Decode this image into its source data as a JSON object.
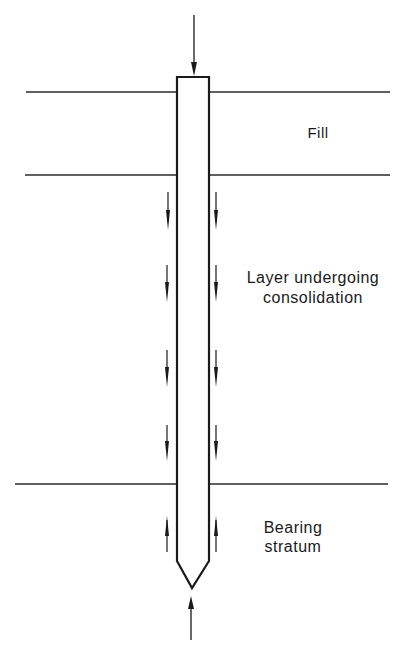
{
  "diagram": {
    "type": "pile-negative-skin-friction",
    "labels": {
      "fill": "Fill",
      "consolidating_layer_line1": "Layer undergoing",
      "consolidating_layer_line2": "consolidation",
      "bearing_line1": "Bearing",
      "bearing_line2": "stratum"
    },
    "layers": [
      {
        "name": "Fill",
        "top_y": 92,
        "bottom_y": 175
      },
      {
        "name": "Layer undergoing consolidation",
        "top_y": 175,
        "bottom_y": 484
      },
      {
        "name": "Bearing stratum",
        "top_y": 484
      }
    ],
    "arrows": {
      "applied_load": "downward",
      "negative_skin_friction": "downward",
      "positive_skin_friction": "upward",
      "end_bearing": "upward"
    },
    "colors": {
      "line": "#1a1a1a",
      "background": "#ffffff"
    }
  }
}
